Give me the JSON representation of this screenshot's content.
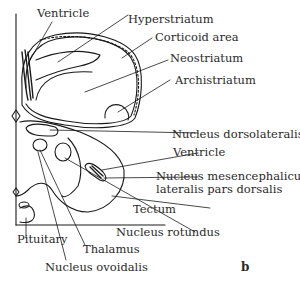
{
  "figure": {
    "panel_letter": "b",
    "labels": {
      "ventricle_top": "Ventricle",
      "hyperstriatum": "Hyperstriatum",
      "corticoid_area": "Corticoid area",
      "neostriatum": "Neostriatum",
      "archistriatum": "Archistriatum",
      "nucleus_dorsolateralis": "Nucleus dorsolateralis",
      "ventricle_mid": "Ventricle",
      "nucleus_mesencephalicus_line1": "Nucleus mesencephalicus",
      "nucleus_mesencephalicus_line2": "lateralis pars dorsalis",
      "tectum": "Tectum",
      "nucleus_rotundus": "Nucleus rotundus",
      "thalamus": "Thalamus",
      "pituitary": "Pituitary",
      "nucleus_ovoidalis": "Nucleus ovoidalis"
    },
    "colors": {
      "ink": "#1a1a1a",
      "text": "#2a2a2a",
      "background": "#ffffff"
    }
  }
}
